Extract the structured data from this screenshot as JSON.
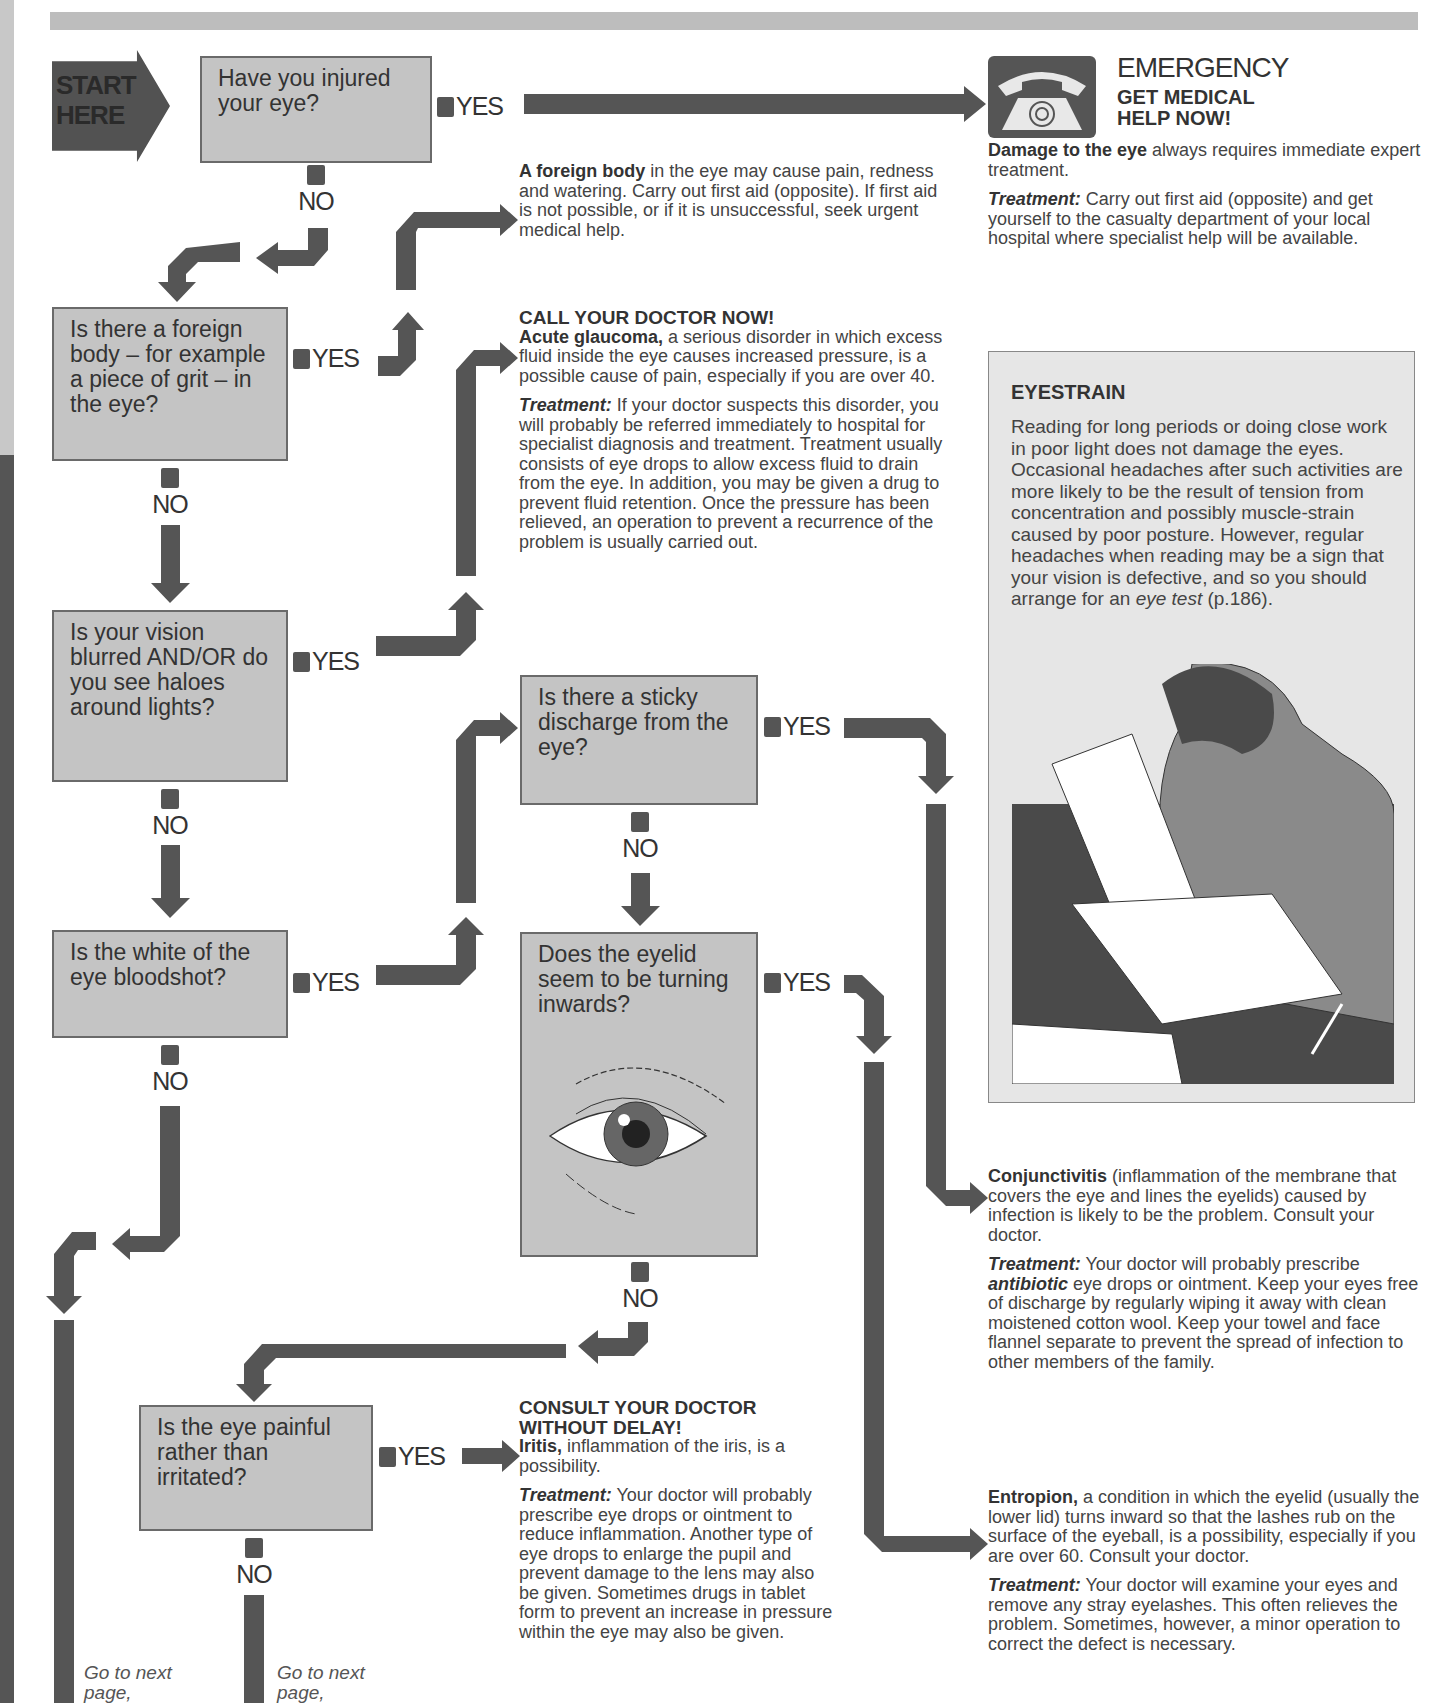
{
  "page": {
    "top_band_color": "#bdbdbd",
    "arrow_color": "#555555",
    "box_fill_color": "#c4c4c4"
  },
  "start": {
    "label_line1": "START",
    "label_line2": "HERE"
  },
  "questions": [
    {
      "id": "q1",
      "text": "Have you injured your eye?"
    },
    {
      "id": "q2",
      "text": "Is there a foreign body – for example a piece of grit – in the eye?"
    },
    {
      "id": "q3",
      "text": "Is your vision blurred AND/OR do you see haloes around lights?"
    },
    {
      "id": "q4",
      "text": "Is the white of the eye bloodshot?"
    },
    {
      "id": "q5",
      "text": "Is there a sticky discharge from the eye?"
    },
    {
      "id": "q6",
      "text": "Does the eyelid seem to be turning inwards?"
    },
    {
      "id": "q7",
      "text": "Is the eye painful rather than irritated?"
    }
  ],
  "labels": {
    "yes": "YES",
    "no": "NO"
  },
  "emergency": {
    "icon": "telephone-icon",
    "title": "EMERGENCY",
    "subtitle_line1": "GET MEDICAL",
    "subtitle_line2": "HELP NOW!",
    "bold_lead": "Damage to the eye",
    "body": " always requires immediate expert treatment.",
    "treatment_label": "Treatment:",
    "treatment": " Carry out first aid (opposite) and get yourself to the casualty department of your local hospital where specialist help will be available."
  },
  "foreign_body": {
    "bold_lead": "A foreign body",
    "body": " in the eye may cause pain, redness and watering. Carry out first aid (opposite). If first aid is not possible, or if it is unsuccessful, seek urgent medical help."
  },
  "glaucoma": {
    "header": "CALL YOUR DOCTOR NOW!",
    "bold_lead": "Acute glaucoma,",
    "body": " a serious disorder in which excess fluid inside the eye causes increased pressure, is a possible cause of pain, especially if you are over 40.",
    "treatment_label": "Treatment:",
    "treatment": " If your doctor suspects this disorder, you will probably be referred immediately to hospital for specialist diagnosis and treatment. Treatment usually consists of eye drops to allow excess fluid to drain from the eye. In addition, you may be given a drug to prevent fluid retention. Once the pressure has been relieved, an operation to prevent a recurrence of the problem is usually carried out."
  },
  "eyestrain": {
    "title": "EYESTRAIN",
    "body": "Reading for long periods or doing close work in poor light does not damage the eyes. Occasional headaches after such activities are more likely to be the result of tension from concentration and possibly muscle-strain caused by poor posture. However, regular headaches when reading may be a sign that your vision is defective, and so you should arrange for an ",
    "link_text": "eye test",
    "link_suffix": " (p.186).",
    "illustration": "man-reading-illustration"
  },
  "conjunctivitis": {
    "bold_lead": "Conjunctivitis",
    "body": " (inflammation of the membrane that covers the eye and lines the eyelids) caused by infection is likely to be the problem. Consult your doctor.",
    "treatment_label": "Treatment:",
    "treatment_pre": " Your doctor will probably prescribe ",
    "treatment_em": "antibiotic",
    "treatment_post": " eye drops or ointment. Keep your eyes free of discharge by regularly wiping it away with clean moistened cotton wool. Keep your towel and face flannel separate to prevent the spread of infection to other members of the family."
  },
  "iritis": {
    "header_line1": "CONSULT YOUR DOCTOR",
    "header_line2": "WITHOUT DELAY!",
    "bold_lead": "Iritis,",
    "body": " inflammation of the iris, is a possibility.",
    "treatment_label": "Treatment:",
    "treatment": " Your doctor will probably prescribe eye drops or ointment to reduce inflammation. Another type of eye drops to enlarge the pupil and prevent damage to the lens may also be given. Sometimes drugs in tablet form to prevent an increase in pressure within the eye may also be given."
  },
  "entropion": {
    "bold_lead": "Entropion,",
    "body": " a condition in which the eyelid (usually the lower lid) turns inward so that the lashes rub on the surface of the eyeball, is a possibility, especially if you are over 60. Consult your doctor.",
    "treatment_label": "Treatment:",
    "treatment": " Your doctor will examine your eyes and remove any stray eyelashes. This often relieves the problem. Sometimes, however, a minor operation to correct the defect is necessary."
  },
  "goto": [
    {
      "line1": "Go to next",
      "line2": "page,"
    },
    {
      "line1": "Go to next",
      "line2": "page,"
    }
  ]
}
